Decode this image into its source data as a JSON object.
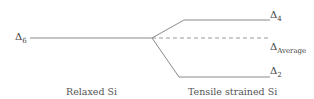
{
  "diagram": {
    "levels": {
      "delta6": {
        "symbol": "Δ",
        "sub": "6"
      },
      "delta4": {
        "symbol": "Δ",
        "sub": "4"
      },
      "average": {
        "symbol": "Δ",
        "sub": "Average"
      },
      "delta2": {
        "symbol": "Δ",
        "sub": "2"
      }
    },
    "captions": {
      "relaxed": "Relaxed Si",
      "strained": "Tensile strained Si"
    },
    "colors": {
      "line": "#8a8a8a",
      "dash": "#999999"
    }
  }
}
